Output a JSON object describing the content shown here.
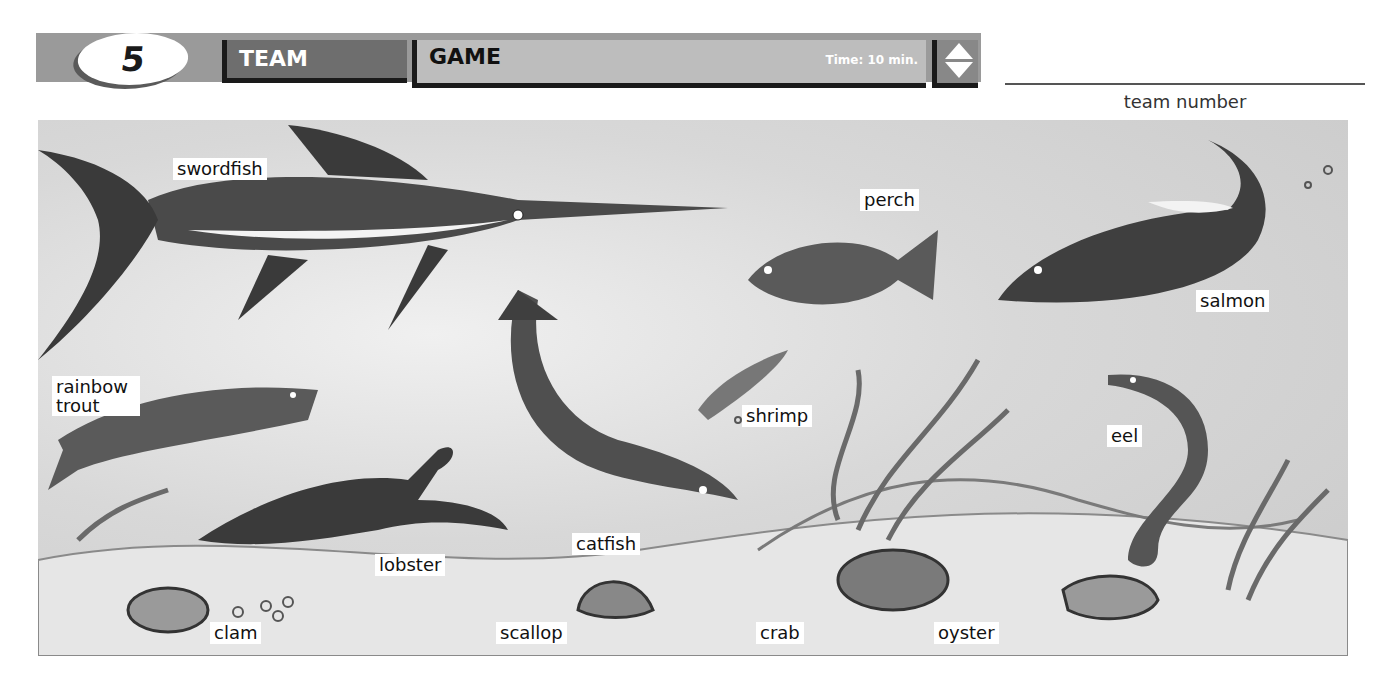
{
  "header": {
    "lesson_number": "5",
    "tab_team": "TEAM",
    "tab_game": "GAME",
    "time": "Time: 10 min.",
    "sort_icon": "up-down-arrows-icon"
  },
  "team_number_label": "team number",
  "scene": {
    "labels": {
      "swordfish": "swordfish",
      "perch": "perch",
      "salmon": "salmon",
      "rainbow_trout": "rainbow trout",
      "shrimp": "shrimp",
      "eel": "eel",
      "catfish": "catfish",
      "lobster": "lobster",
      "clam": "clam",
      "scallop": "scallop",
      "crab": "crab",
      "oyster": "oyster"
    }
  }
}
